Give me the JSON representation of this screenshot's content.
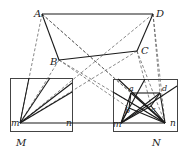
{
  "diagram": {
    "width": 189,
    "height": 155,
    "colors": {
      "stroke": "#1a1a1a",
      "dashed": "#555555",
      "box": "#444444",
      "label": "#222222"
    },
    "points": {
      "A": [
        42,
        14
      ],
      "D": [
        153,
        14
      ],
      "B": [
        59,
        60
      ],
      "C": [
        137,
        51
      ],
      "Mm": [
        20,
        123
      ],
      "Mn": [
        66,
        123
      ],
      "Nm": [
        121,
        123
      ],
      "Nn": [
        165,
        123
      ],
      "a": [
        131,
        93
      ],
      "d": [
        160,
        93
      ],
      "b": [
        129,
        108
      ],
      "c": [
        151,
        106
      ]
    },
    "boxes": [
      {
        "name": "box-M",
        "x": 10,
        "y": 78,
        "w": 62,
        "h": 53
      },
      {
        "name": "box-N",
        "x": 113,
        "y": 79,
        "w": 64,
        "h": 52
      }
    ],
    "solid_lines": [
      [
        "A",
        "D"
      ],
      [
        "A",
        "B"
      ],
      [
        "B",
        "C"
      ],
      [
        "C",
        "D"
      ],
      [
        "Mm",
        "Mn"
      ],
      [
        "Mn",
        "Nm"
      ],
      [
        "Nm",
        "Nn"
      ],
      [
        "a",
        "d"
      ],
      [
        "Nm",
        "a"
      ],
      [
        "Nn",
        "d"
      ],
      [
        "Nm",
        "b"
      ],
      [
        "Nm",
        "c"
      ],
      [
        "Nm",
        "d"
      ],
      [
        "Nn",
        "a"
      ],
      [
        "Nn",
        "b"
      ],
      [
        "Nn",
        "c"
      ],
      [
        "a",
        "b"
      ],
      [
        "d",
        "c"
      ],
      [
        "Mm",
        "P1"
      ],
      [
        "Mm",
        "P2"
      ],
      [
        "Mm",
        "P3"
      ],
      [
        "Mm",
        "P4"
      ],
      [
        "Nm",
        "Q1"
      ],
      [
        "Nn",
        "Q2"
      ],
      [
        "Nm",
        "Q3"
      ],
      [
        "Nn",
        "Q4"
      ]
    ],
    "aux_points": {
      "P1": [
        29,
        78
      ],
      "P2": [
        50,
        78
      ],
      "P3": [
        72,
        83
      ],
      "P4": [
        72,
        92
      ],
      "Q1": [
        145,
        79
      ],
      "Q2": [
        118,
        79
      ],
      "Q3": [
        177,
        86
      ],
      "Q4": [
        113,
        92
      ]
    },
    "dashed_lines": [
      [
        "A",
        "Mm"
      ],
      [
        "A",
        "Nn"
      ],
      [
        "D",
        "Mm"
      ],
      [
        "D",
        "Nn"
      ],
      [
        "B",
        "Mm"
      ],
      [
        "B",
        "Nn"
      ],
      [
        "C",
        "Mm"
      ],
      [
        "C",
        "Nn"
      ],
      [
        "A",
        "a"
      ],
      [
        "D",
        "d"
      ],
      [
        "B",
        "b"
      ],
      [
        "C",
        "c"
      ]
    ],
    "labels": [
      {
        "text": "A",
        "x": 34,
        "y": 17,
        "size": 10
      },
      {
        "text": "D",
        "x": 156,
        "y": 17,
        "size": 10
      },
      {
        "text": "B",
        "x": 50,
        "y": 65,
        "size": 10
      },
      {
        "text": "C",
        "x": 141,
        "y": 54,
        "size": 10
      },
      {
        "text": "m",
        "x": 11,
        "y": 126,
        "size": 9
      },
      {
        "text": "n",
        "x": 66,
        "y": 126,
        "size": 9
      },
      {
        "text": "m",
        "x": 113,
        "y": 127,
        "size": 9
      },
      {
        "text": "n",
        "x": 170,
        "y": 126,
        "size": 9
      },
      {
        "text": "a",
        "x": 129,
        "y": 91,
        "size": 8
      },
      {
        "text": "d",
        "x": 162,
        "y": 91,
        "size": 8
      },
      {
        "text": "b",
        "x": 125,
        "y": 113,
        "size": 8
      },
      {
        "text": "c",
        "x": 151,
        "y": 112,
        "size": 8
      },
      {
        "text": "M",
        "x": 16,
        "y": 146,
        "size": 10
      },
      {
        "text": "N",
        "x": 152,
        "y": 146,
        "size": 10
      }
    ]
  }
}
